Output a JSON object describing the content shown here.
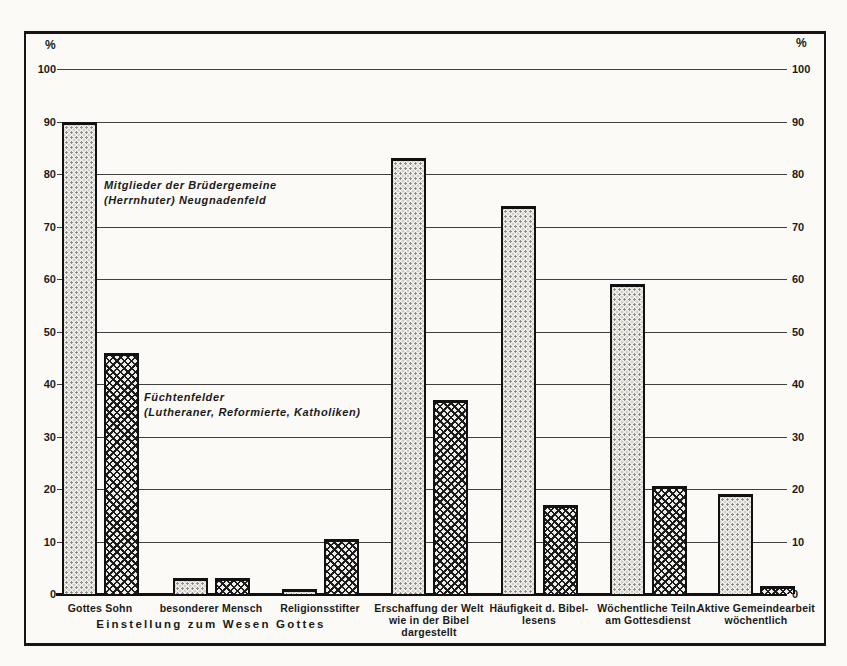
{
  "colors": {
    "ink": "#1a1a1a",
    "paper": "#fbfaf7"
  },
  "chart_data": {
    "type": "bar",
    "unit": "%",
    "axis_label_left": "%",
    "axis_label_right": "%",
    "ylim": [
      0,
      100
    ],
    "yticks": [
      0,
      10,
      20,
      30,
      40,
      50,
      60,
      70,
      80,
      90,
      100
    ],
    "grid": true,
    "legend_position": "text annotations inside plot area",
    "categories": [
      "Gottes Sohn",
      "besonderer Mensch",
      "Religionsstifter",
      "Erschaffung der Welt\nwie in der Bibel\ndargestellt",
      "Häufigkeit d. Bibel-\nlesens",
      "Wöchentliche Teiln.\nam Gottesdienst",
      "Aktive Gemeindearbeit\nwöchentlich"
    ],
    "x_group_caption": "Einstellung zum Wesen Gottes",
    "x_group_caption_span_category_indexes": [
      0,
      1,
      2
    ],
    "series": [
      {
        "name": "Mitglieder der Brüdergemeine (Herrnhuter) Neugnadenfeld",
        "label_lines": [
          "Mitglieder der Brüdergemeine",
          "(Herrnhuter) Neugnadenfeld"
        ],
        "pattern": "stipple-dots",
        "values": [
          90,
          3,
          1,
          83,
          74,
          59,
          19
        ]
      },
      {
        "name": "Füchtenfelder (Lutheraner, Reformierte, Katholiken)",
        "label_lines": [
          "Füchtenfelder",
          "(Lutheraner, Reformierte, Katholiken)"
        ],
        "pattern": "crosshatch",
        "values": [
          46,
          3,
          10.5,
          37,
          17,
          20.5,
          1.5
        ]
      }
    ],
    "layout_hints": {
      "group_centers_px": [
        100,
        211,
        320,
        429,
        539,
        648,
        756
      ],
      "bar_width_px": 35,
      "bar_gap_px": 7,
      "baseline_y_px": 594,
      "top100_y_px": 69,
      "plot_left_px": 57,
      "plot_right_px": 787
    }
  }
}
